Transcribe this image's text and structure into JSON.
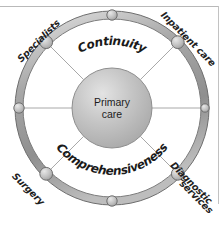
{
  "figure": {
    "center": {
      "line1": "Primary",
      "line2": "care"
    },
    "inner_arc_labels": [
      {
        "text": "Continuity",
        "position": "top"
      },
      {
        "text": "Comprehensiveness",
        "position": "bottom"
      }
    ],
    "outer_labels": [
      {
        "text": "Specialists",
        "position": "top-left",
        "rotation": -45
      },
      {
        "text": "Inpatient care",
        "position": "top-right",
        "rotation": 45
      },
      {
        "text": "Diagnostic",
        "position": "bottom-right-line1",
        "rotation": 45
      },
      {
        "text": "services",
        "position": "bottom-right-line2",
        "rotation": 45
      },
      {
        "text": "Surgery",
        "position": "bottom-left",
        "rotation": 45
      }
    ],
    "nodes": [
      {
        "name": "node-top",
        "angle_deg": 270,
        "size": "small"
      },
      {
        "name": "node-top-right",
        "angle_deg": 315,
        "size": "large"
      },
      {
        "name": "node-right",
        "angle_deg": 0,
        "size": "small"
      },
      {
        "name": "node-bottom-right",
        "angle_deg": 45,
        "size": "large"
      },
      {
        "name": "node-bottom",
        "angle_deg": 90,
        "size": "small"
      },
      {
        "name": "node-bottom-left",
        "angle_deg": 135,
        "size": "large"
      },
      {
        "name": "node-left",
        "angle_deg": 180,
        "size": "small"
      },
      {
        "name": "node-top-left",
        "angle_deg": 225,
        "size": "large"
      }
    ],
    "colors": {
      "ring_band": "#9a9a9a",
      "ring_band_light": "#d2d2d2",
      "ring_outline": "#707070",
      "inner_circle": "#b4b4b4",
      "inner_circle_light": "#d8d8d8",
      "node_fill": "#c6c6c6",
      "node_outline": "#6f6f6f",
      "spoke": "#a8a8a8",
      "text": "#1f1f1f",
      "frame": "#b9b9b9",
      "background": "#ffffff"
    },
    "geometry": {
      "center_x": 112,
      "center_y": 108,
      "ring_radius": 93,
      "ring_band_width": 8,
      "inner_radius": 40
    }
  }
}
